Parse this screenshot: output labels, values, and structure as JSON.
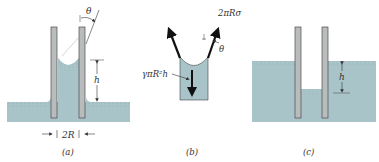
{
  "colors": {
    "liquid": "#a9c4c8",
    "liquid_surface": "#93b3b8",
    "tube": "#b9bcbd",
    "tube_stroke": "#4a4a4a",
    "arrow": "#111111",
    "text": "#333333"
  },
  "panels": [
    {
      "id": "a",
      "caption": "(a)",
      "labels": {
        "height": "h",
        "angle": "θ",
        "diameter": "2R"
      }
    },
    {
      "id": "b",
      "caption": "(b)",
      "labels": {
        "surface_tension_force": "2πRσ",
        "angle": "θ",
        "weight": "γπR²h"
      }
    },
    {
      "id": "c",
      "caption": "(c)",
      "labels": {
        "height": "h"
      }
    }
  ]
}
